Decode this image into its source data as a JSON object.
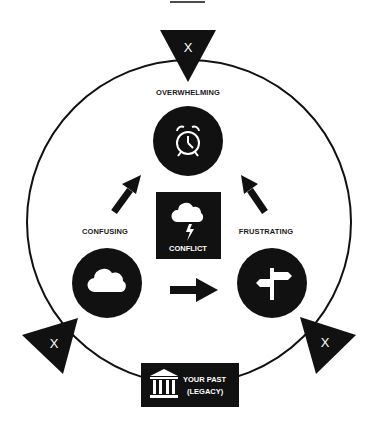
{
  "diagram": {
    "colors": {
      "ink": "#111111",
      "paper": "#ffffff"
    },
    "outer_cycle": {
      "shape": "circle",
      "markers": [
        "X",
        "X",
        "X"
      ]
    },
    "nodes": {
      "top": {
        "label": "OVERWHELMING",
        "icon": "alarm-clock-icon"
      },
      "left": {
        "label": "CONFUSING",
        "icon": "cloud-icon"
      },
      "right": {
        "label": "FRUSTRATING",
        "icon": "signpost-icon"
      },
      "center": {
        "label": "CONFLICT",
        "icon": "storm-cloud-icon"
      }
    },
    "legacy": {
      "line1": "YOUR PAST",
      "line2": "(LEGACY)",
      "icon": "bank-building-icon"
    },
    "markers": {
      "top": "X",
      "left": "X",
      "right": "X"
    },
    "arrows": [
      {
        "from": "CONFUSING",
        "to": "OVERWHELMING"
      },
      {
        "from": "CONFUSING",
        "to": "FRUSTRATING"
      },
      {
        "from": "FRUSTRATING",
        "to": "OVERWHELMING"
      }
    ]
  }
}
